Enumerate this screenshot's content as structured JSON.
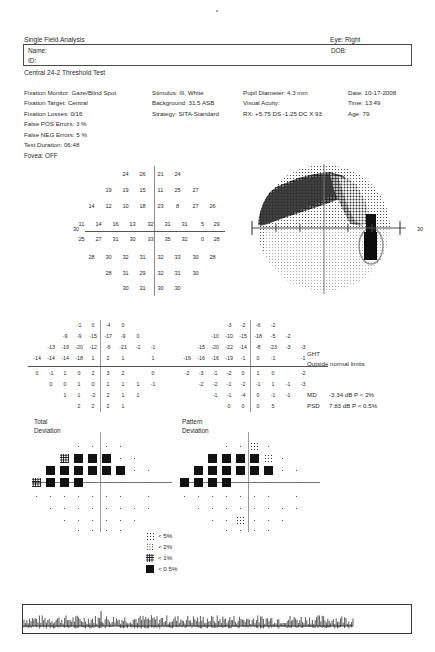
{
  "header": {
    "title": "Single Field Analysis",
    "eye": "Eye: Right",
    "name_label": "Name:",
    "id_label": "ID:",
    "dob_label": "DOB:",
    "test_name": "Central 24-2 Threshold Test"
  },
  "params": {
    "col1": [
      "Fixation Monitor: Gaze/Blind Spot",
      "Fixation Target: Central",
      "Fixation Losses: 0/16",
      "False POS Errors:  3 %",
      "False NEG Errors:  5 %",
      "Test Duration: 06:48"
    ],
    "col2": [
      "Stimulus: III, White",
      "Background: 31.5 ASB",
      "Strategy: SITA-Standard"
    ],
    "col3": [
      "Pupil Diameter: 4.3 mm",
      "Visual Acuity:",
      "RX: +5.75 DS  -1.25 DC X 93"
    ],
    "col4": [
      "Date: 10-17-2008",
      "Time: 13:49",
      "Age: 79"
    ],
    "fovea": "Fovea: OFF"
  },
  "threshold_plot": {
    "axis_label_left": "30",
    "axis_label_right": "30",
    "rows": [
      {
        "y": 5,
        "values": [
          {
            "x": 35,
            "v": "24"
          },
          {
            "x": 52,
            "v": "26"
          },
          {
            "x": 70,
            "v": "21"
          },
          {
            "x": 87,
            "v": "24"
          }
        ]
      },
      {
        "y": 21,
        "values": [
          {
            "x": 18,
            "v": "19"
          },
          {
            "x": 35,
            "v": "19"
          },
          {
            "x": 52,
            "v": "15"
          },
          {
            "x": 70,
            "v": "11"
          },
          {
            "x": 87,
            "v": "25"
          },
          {
            "x": 105,
            "v": "27"
          }
        ]
      },
      {
        "y": 37,
        "values": [
          {
            "x": 1,
            "v": "14"
          },
          {
            "x": 18,
            "v": "12"
          },
          {
            "x": 35,
            "v": "10"
          },
          {
            "x": 52,
            "v": "18"
          },
          {
            "x": 70,
            "v": "23"
          },
          {
            "x": 87,
            "v": "8"
          },
          {
            "x": 105,
            "v": "27"
          },
          {
            "x": 122,
            "v": "26"
          }
        ]
      },
      {
        "y": 55,
        "values": [
          {
            "x": -9,
            "v": "11"
          },
          {
            "x": 8,
            "v": "14"
          },
          {
            "x": 25,
            "v": "16"
          },
          {
            "x": 42,
            "v": "13"
          },
          {
            "x": 60,
            "v": "32"
          },
          {
            "x": 77,
            "v": "31"
          },
          {
            "x": 94,
            "v": "31"
          },
          {
            "x": 112,
            "v": "5"
          },
          {
            "x": 126,
            "v": "29"
          }
        ]
      },
      {
        "y": 70,
        "values": [
          {
            "x": -9,
            "v": "25"
          },
          {
            "x": 8,
            "v": "27"
          },
          {
            "x": 25,
            "v": "31"
          },
          {
            "x": 42,
            "v": "30"
          },
          {
            "x": 60,
            "v": "33"
          },
          {
            "x": 77,
            "v": "35"
          },
          {
            "x": 94,
            "v": "32"
          },
          {
            "x": 112,
            "v": "0"
          },
          {
            "x": 126,
            "v": "28"
          }
        ]
      },
      {
        "y": 88,
        "values": [
          {
            "x": 1,
            "v": "28"
          },
          {
            "x": 18,
            "v": "30"
          },
          {
            "x": 35,
            "v": "32"
          },
          {
            "x": 52,
            "v": "31"
          },
          {
            "x": 70,
            "v": "32"
          },
          {
            "x": 87,
            "v": "33"
          },
          {
            "x": 105,
            "v": "30"
          },
          {
            "x": 122,
            "v": "28"
          }
        ]
      },
      {
        "y": 104,
        "values": [
          {
            "x": 18,
            "v": "28"
          },
          {
            "x": 35,
            "v": "31"
          },
          {
            "x": 52,
            "v": "29"
          },
          {
            "x": 70,
            "v": "32"
          },
          {
            "x": 87,
            "v": "31"
          },
          {
            "x": 105,
            "v": "30"
          }
        ]
      },
      {
        "y": 119,
        "values": [
          {
            "x": 35,
            "v": "30"
          },
          {
            "x": 52,
            "v": "31"
          },
          {
            "x": 70,
            "v": "30"
          },
          {
            "x": 87,
            "v": "30"
          }
        ]
      }
    ]
  },
  "total_deviation": {
    "caption_line1": "Total",
    "caption_line2": "Deviation",
    "rows": [
      {
        "y": 2,
        "values": [
          {
            "x": 44,
            "v": "-1"
          },
          {
            "x": 58,
            "v": "0"
          },
          {
            "x": 73,
            "v": "-4"
          },
          {
            "x": 88,
            "v": "0"
          }
        ]
      },
      {
        "y": 13,
        "values": [
          {
            "x": 30,
            "v": "-9"
          },
          {
            "x": 44,
            "v": "-9"
          },
          {
            "x": 58,
            "v": "-15"
          },
          {
            "x": 73,
            "v": "-17"
          },
          {
            "x": 88,
            "v": "-9"
          },
          {
            "x": 103,
            "v": "0"
          }
        ]
      },
      {
        "y": 24,
        "values": [
          {
            "x": 16,
            "v": "-13"
          },
          {
            "x": 30,
            "v": "-19"
          },
          {
            "x": 44,
            "v": "-20"
          },
          {
            "x": 58,
            "v": "-12"
          },
          {
            "x": 73,
            "v": "-6"
          },
          {
            "x": 88,
            "v": "-21"
          },
          {
            "x": 103,
            "v": "-1"
          },
          {
            "x": 118,
            "v": "-1"
          }
        ]
      },
      {
        "y": 35,
        "values": [
          {
            "x": 2,
            "v": "-14"
          },
          {
            "x": 16,
            "v": "-14"
          },
          {
            "x": 30,
            "v": "-14"
          },
          {
            "x": 44,
            "v": "-18"
          },
          {
            "x": 58,
            "v": "1"
          },
          {
            "x": 73,
            "v": "2"
          },
          {
            "x": 88,
            "v": "1"
          },
          {
            "x": 118,
            "v": "1"
          }
        ]
      },
      {
        "y": 50,
        "values": [
          {
            "x": 2,
            "v": "0"
          },
          {
            "x": 16,
            "v": "-1"
          },
          {
            "x": 30,
            "v": "1"
          },
          {
            "x": 44,
            "v": "0"
          },
          {
            "x": 58,
            "v": "2"
          },
          {
            "x": 73,
            "v": "3"
          },
          {
            "x": 88,
            "v": "2"
          },
          {
            "x": 118,
            "v": "0"
          }
        ]
      },
      {
        "y": 61,
        "values": [
          {
            "x": 16,
            "v": "0"
          },
          {
            "x": 30,
            "v": "0"
          },
          {
            "x": 44,
            "v": "1"
          },
          {
            "x": 58,
            "v": "0"
          },
          {
            "x": 73,
            "v": "1"
          },
          {
            "x": 88,
            "v": "1"
          },
          {
            "x": 103,
            "v": "1"
          },
          {
            "x": 118,
            "v": "-1"
          }
        ]
      },
      {
        "y": 72,
        "values": [
          {
            "x": 30,
            "v": "1"
          },
          {
            "x": 44,
            "v": "1"
          },
          {
            "x": 58,
            "v": "-2"
          },
          {
            "x": 73,
            "v": "2"
          },
          {
            "x": 88,
            "v": "1"
          },
          {
            "x": 103,
            "v": "1"
          }
        ]
      },
      {
        "y": 83,
        "values": [
          {
            "x": 44,
            "v": "2"
          },
          {
            "x": 58,
            "v": "2"
          },
          {
            "x": 73,
            "v": "2"
          },
          {
            "x": 88,
            "v": "1"
          }
        ]
      }
    ]
  },
  "pattern_deviation": {
    "caption_line1": "Pattern",
    "caption_line2": "Deviation",
    "rows": [
      {
        "y": 2,
        "values": [
          {
            "x": 44,
            "v": "-3"
          },
          {
            "x": 58,
            "v": "-2"
          },
          {
            "x": 73,
            "v": "-6"
          },
          {
            "x": 88,
            "v": "-2"
          }
        ]
      },
      {
        "y": 13,
        "values": [
          {
            "x": 30,
            "v": "-10"
          },
          {
            "x": 44,
            "v": "-10"
          },
          {
            "x": 58,
            "v": "-15"
          },
          {
            "x": 73,
            "v": "-18"
          },
          {
            "x": 88,
            "v": "-5"
          },
          {
            "x": 103,
            "v": "-2"
          }
        ]
      },
      {
        "y": 24,
        "values": [
          {
            "x": 16,
            "v": "-15"
          },
          {
            "x": 30,
            "v": "-20"
          },
          {
            "x": 44,
            "v": "-22"
          },
          {
            "x": 58,
            "v": "-14"
          },
          {
            "x": 73,
            "v": "-8"
          },
          {
            "x": 88,
            "v": "-23"
          },
          {
            "x": 103,
            "v": "-3"
          },
          {
            "x": 118,
            "v": "-3"
          }
        ]
      },
      {
        "y": 35,
        "values": [
          {
            "x": 2,
            "v": "-16"
          },
          {
            "x": 16,
            "v": "-16"
          },
          {
            "x": 30,
            "v": "-16"
          },
          {
            "x": 44,
            "v": "-19"
          },
          {
            "x": 58,
            "v": "-1"
          },
          {
            "x": 73,
            "v": "0"
          },
          {
            "x": 88,
            "v": "-1"
          },
          {
            "x": 118,
            "v": "-1"
          }
        ]
      },
      {
        "y": 50,
        "values": [
          {
            "x": 2,
            "v": "-2"
          },
          {
            "x": 16,
            "v": "-3"
          },
          {
            "x": 30,
            "v": "-1"
          },
          {
            "x": 44,
            "v": "-2"
          },
          {
            "x": 58,
            "v": "0"
          },
          {
            "x": 73,
            "v": "1"
          },
          {
            "x": 88,
            "v": "0"
          },
          {
            "x": 118,
            "v": "-2"
          }
        ]
      },
      {
        "y": 61,
        "values": [
          {
            "x": 16,
            "v": "-2"
          },
          {
            "x": 30,
            "v": "-2"
          },
          {
            "x": 44,
            "v": "-1"
          },
          {
            "x": 58,
            "v": "-2"
          },
          {
            "x": 73,
            "v": "-1"
          },
          {
            "x": 88,
            "v": "1"
          },
          {
            "x": 103,
            "v": "-1"
          },
          {
            "x": 118,
            "v": "-3"
          }
        ]
      },
      {
        "y": 72,
        "values": [
          {
            "x": 30,
            "v": "-1"
          },
          {
            "x": 44,
            "v": "-1"
          },
          {
            "x": 58,
            "v": "-4"
          },
          {
            "x": 73,
            "v": "0"
          },
          {
            "x": 88,
            "v": "-1"
          },
          {
            "x": 103,
            "v": "-1"
          }
        ]
      },
      {
        "y": 83,
        "values": [
          {
            "x": 44,
            "v": "0"
          },
          {
            "x": 58,
            "v": "0"
          },
          {
            "x": 73,
            "v": "0"
          },
          {
            "x": 88,
            "v": "5"
          }
        ]
      }
    ]
  },
  "indices": {
    "ght_label": "GHT",
    "ght_value": "Outside normal limits",
    "md_key": "MD",
    "md_value": "-3.34 dB P < 2%",
    "psd_key": "PSD",
    "psd_value": "7.83 dB P < 0.5%"
  },
  "legend": {
    "items": [
      {
        "sym": "s5",
        "label": "< 5%"
      },
      {
        "sym": "s2",
        "label": "< 2%"
      },
      {
        "sym": "s1",
        "label": "< 1%"
      },
      {
        "sym": "s05",
        "label": "< 0.5%"
      }
    ]
  },
  "prob_plots": {
    "total": [
      {
        "y": 10,
        "cells": [
          "dot",
          "dot",
          "dot",
          "dot"
        ],
        "xs": [
          42,
          56,
          70,
          84
        ]
      },
      {
        "y": 22,
        "cells": [
          "s1",
          "s05",
          "s05",
          "s05",
          "dot",
          "dot"
        ],
        "xs": [
          28,
          42,
          56,
          70,
          84,
          98
        ]
      },
      {
        "y": 34,
        "cells": [
          "s05",
          "s05",
          "s05",
          "s05",
          "s05",
          "s05",
          "dot",
          "dot"
        ],
        "xs": [
          14,
          28,
          42,
          56,
          70,
          84,
          98,
          112
        ]
      },
      {
        "y": 46,
        "cells": [
          "s1",
          "s05",
          "s05",
          "s05",
          "dot",
          "dot",
          "dot",
          "dot"
        ],
        "xs": [
          0,
          14,
          28,
          42,
          56,
          70,
          84,
          112
        ]
      },
      {
        "y": 60,
        "cells": [
          "dot",
          "dot",
          "dot",
          "dot",
          "dot",
          "dot",
          "dot",
          "dot"
        ],
        "xs": [
          0,
          14,
          28,
          42,
          56,
          70,
          84,
          112
        ]
      },
      {
        "y": 72,
        "cells": [
          "dot",
          "dot",
          "dot",
          "dot",
          "dot",
          "dot",
          "dot",
          "dot"
        ],
        "xs": [
          14,
          28,
          42,
          56,
          70,
          84,
          98,
          112
        ]
      },
      {
        "y": 84,
        "cells": [
          "dot",
          "dot",
          "dot",
          "dot",
          "dot",
          "dot"
        ],
        "xs": [
          28,
          42,
          56,
          70,
          84,
          98
        ]
      },
      {
        "y": 94,
        "cells": [
          "dot",
          "dot",
          "dot",
          "dot"
        ],
        "xs": [
          42,
          56,
          70,
          84
        ]
      }
    ],
    "pattern": [
      {
        "y": 10,
        "cells": [
          "dot",
          "dot",
          "s5",
          "dot"
        ],
        "xs": [
          42,
          56,
          70,
          84
        ]
      },
      {
        "y": 22,
        "cells": [
          "s05",
          "s05",
          "s05",
          "s05",
          "s5",
          "dot"
        ],
        "xs": [
          28,
          42,
          56,
          70,
          84,
          98
        ]
      },
      {
        "y": 34,
        "cells": [
          "s05",
          "s05",
          "s05",
          "s05",
          "s05",
          "s05",
          "dot",
          "dot"
        ],
        "xs": [
          14,
          28,
          42,
          56,
          70,
          84,
          98,
          112
        ]
      },
      {
        "y": 46,
        "cells": [
          "s05",
          "s05",
          "s05",
          "s05",
          "dot",
          "dot",
          "dot",
          "dot"
        ],
        "xs": [
          0,
          14,
          28,
          42,
          56,
          70,
          84,
          112
        ]
      },
      {
        "y": 60,
        "cells": [
          "dot",
          "dot",
          "dot",
          "dot",
          "dot",
          "dot",
          "dot",
          "dot"
        ],
        "xs": [
          0,
          14,
          28,
          42,
          56,
          70,
          84,
          112
        ]
      },
      {
        "y": 72,
        "cells": [
          "dot",
          "dot",
          "dot",
          "dot",
          "dot",
          "dot",
          "dot",
          "dot"
        ],
        "xs": [
          14,
          28,
          42,
          56,
          70,
          84,
          98,
          112
        ]
      },
      {
        "y": 84,
        "cells": [
          "dot",
          "dot",
          "s5",
          "dot",
          "dot",
          "dot"
        ],
        "xs": [
          28,
          42,
          56,
          70,
          84,
          98
        ]
      },
      {
        "y": 94,
        "cells": [
          "dot",
          "dot",
          "dot",
          "dot"
        ],
        "xs": [
          42,
          56,
          70,
          84
        ]
      }
    ]
  }
}
